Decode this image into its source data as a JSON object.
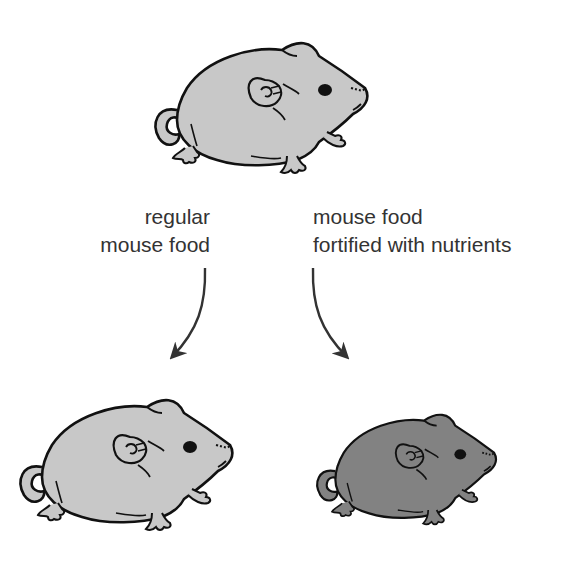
{
  "diagram": {
    "type": "experiment-flow",
    "colors": {
      "control_mouse_fill": "#c8c8c8",
      "treated_mouse_fill": "#828282",
      "outline": "#111111",
      "arrow": "#333333",
      "text": "#333333"
    },
    "nodes": [
      {
        "id": "parent_mouse",
        "label": "",
        "fill": "#c8c8c8"
      },
      {
        "id": "mouse_regular_food",
        "label": "",
        "fill": "#c8c8c8"
      },
      {
        "id": "mouse_fortified_food",
        "label": "",
        "fill": "#828282"
      }
    ],
    "edges": [
      {
        "from": "parent_mouse",
        "to": "mouse_regular_food",
        "label_lines": [
          "regular",
          "mouse food"
        ]
      },
      {
        "from": "parent_mouse",
        "to": "mouse_fortified_food",
        "label_lines": [
          "mouse food",
          "fortified with nutrients"
        ]
      }
    ]
  },
  "labels": {
    "left_line1": "regular",
    "left_line2": "mouse food",
    "right_line1": "mouse food",
    "right_line2": "fortified with nutrients"
  }
}
